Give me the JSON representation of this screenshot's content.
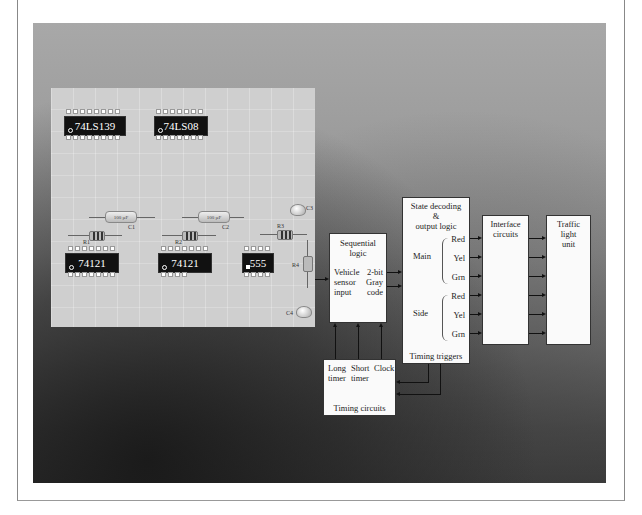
{
  "pcb": {
    "chips": [
      {
        "label": "74LS139"
      },
      {
        "label": "74LS08"
      },
      {
        "label": "74121"
      },
      {
        "label": "74121"
      },
      {
        "label": "555"
      }
    ],
    "capacitors": [
      {
        "label": "C1",
        "value": "100 µF"
      },
      {
        "label": "C2",
        "value": "100 µF"
      },
      {
        "label": "C3"
      },
      {
        "label": "C4"
      }
    ],
    "resistors": [
      {
        "label": "R1"
      },
      {
        "label": "R2"
      },
      {
        "label": "R3"
      },
      {
        "label": "R4"
      }
    ]
  },
  "diagram": {
    "sequential_logic": {
      "title_line1": "Sequential",
      "title_line2": "logic",
      "input_line1": "Vehicle",
      "input_line2": "sensor",
      "input_line3": "input",
      "output_line1": "2-bit",
      "output_line2": "Gray",
      "output_line3": "code"
    },
    "state_decoding": {
      "title_line1": "State decoding",
      "title_line2": "&",
      "title_line3": "output logic",
      "main_label": "Main",
      "side_label": "Side",
      "main_outputs": [
        "Red",
        "Yel",
        "Grn"
      ],
      "side_outputs": [
        "Red",
        "Yel",
        "Grn"
      ],
      "footer": "Timing triggers"
    },
    "interface": {
      "title_line1": "Interface",
      "title_line2": "circuits"
    },
    "traffic_light": {
      "title_line1": "Traffic",
      "title_line2": "light",
      "title_line3": "unit"
    },
    "timing": {
      "col1_line1": "Long",
      "col1_line2": "timer",
      "col2_line1": "Short",
      "col2_line2": "timer",
      "col3": "Clock",
      "footer": "Timing circuits"
    }
  }
}
